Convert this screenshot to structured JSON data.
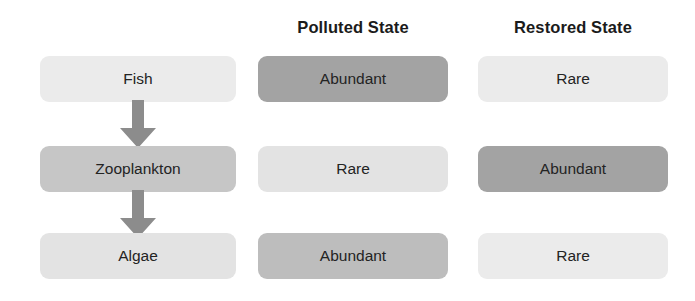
{
  "diagram": {
    "background_color": "#ffffff",
    "headers": {
      "organism_column": "",
      "polluted": "Polluted State",
      "restored": "Restored State"
    },
    "colors": {
      "light": "#ebebeb",
      "light_alt": "#e3e3e3",
      "mid": "#c6c6c6",
      "mid_alt": "#bdbdbd",
      "dark": "#a3a3a3",
      "text": "#232323",
      "header_text": "#1b1b1b",
      "arrow": "#8c8c8c"
    },
    "rows": [
      {
        "organism": "Fish",
        "organism_tone": "light",
        "polluted": "Abundant",
        "polluted_tone": "dark",
        "restored": "Rare",
        "restored_tone": "light"
      },
      {
        "organism": "Zooplankton",
        "organism_tone": "mid",
        "polluted": "Rare",
        "polluted_tone": "light_alt",
        "restored": "Abundant",
        "restored_tone": "dark"
      },
      {
        "organism": "Algae",
        "organism_tone": "light_alt",
        "polluted": "Abundant",
        "polluted_tone": "mid_alt",
        "restored": "Rare",
        "restored_tone": "light"
      }
    ],
    "arrows": [
      {
        "from": "Fish",
        "to": "Zooplankton",
        "direction": "down"
      },
      {
        "from": "Zooplankton",
        "to": "Algae",
        "direction": "down"
      }
    ]
  }
}
